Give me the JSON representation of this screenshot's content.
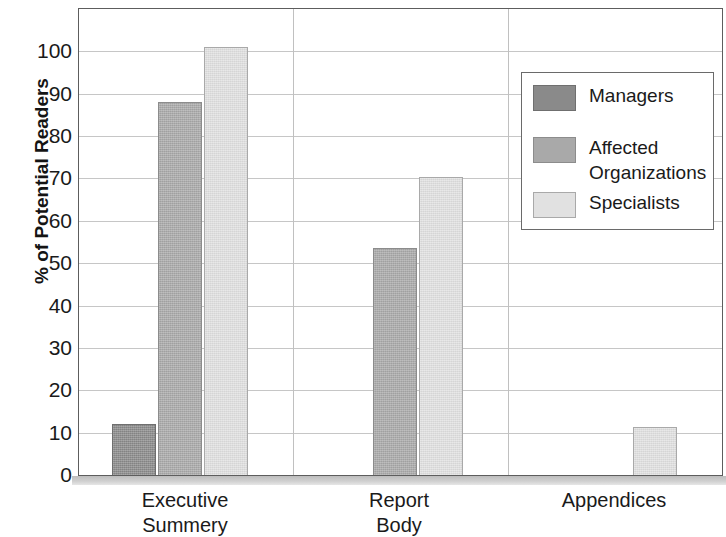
{
  "chart_data": {
    "type": "bar",
    "title": "",
    "subtitle": "",
    "xlabel": "",
    "ylabel": "% of Potential Readers",
    "categories": [
      "Executive Summery",
      "Report Body",
      "Appendices"
    ],
    "category_lines": [
      [
        "Executive",
        "Summery"
      ],
      [
        "Report",
        "Body"
      ],
      [
        "Appendices"
      ]
    ],
    "series": [
      {
        "name": "Managers",
        "color": "#8a8a8a",
        "values": [
          12,
          0,
          0
        ]
      },
      {
        "name": "Affected Organizations",
        "color": "#a9a9a9",
        "values": [
          88,
          53.5,
          0
        ]
      },
      {
        "name": "Specialists",
        "color": "#e1e1e1",
        "values": [
          101,
          70.3,
          11.3
        ]
      }
    ],
    "ylim": [
      0,
      110
    ],
    "y_ticks": [
      0,
      10,
      20,
      30,
      40,
      50,
      60,
      70,
      80,
      90,
      100
    ],
    "y_tick_labels": [
      "0",
      "10",
      "20",
      "30",
      "40",
      "50",
      "60",
      "70",
      "80",
      "90",
      "100"
    ],
    "grid": true,
    "grid_axis": "y",
    "legend_position": "upper right",
    "legend_entries": [
      "Managers",
      "Affected\nOrganizations",
      "Specialists"
    ]
  },
  "legend": {
    "items": [
      {
        "label": "Managers"
      },
      {
        "label": "Affected\nOrganizations"
      },
      {
        "label": "Specialists"
      }
    ]
  },
  "axes": {
    "y_title": "% of Potential Readers"
  }
}
